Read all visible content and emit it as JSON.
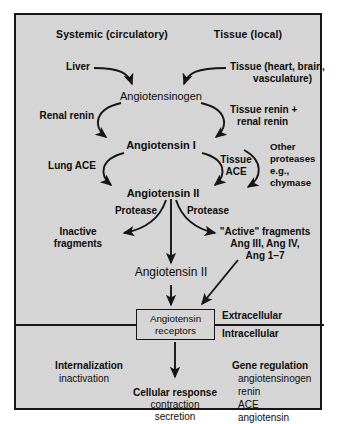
{
  "figure": {
    "title_left": "Systemic (circulatory)",
    "title_right": "Tissue (local)",
    "background_color": "#d5d5d5",
    "line_color": "#161616",
    "text_color": "#0c0c0c"
  },
  "sources": {
    "liver": "Liver",
    "tissue_line1": "Tissue (heart, brain,",
    "tissue_line2": "vasculature)"
  },
  "nodes": {
    "angiotensinogen": "Angiotensinogen",
    "angiotensin_1": "Angiotensin I",
    "angiotensin_2": "Angiotensin II",
    "angiotensin_2_pool": "Angiotensin II",
    "receptors_line1": "Angiotensin",
    "receptors_line2": "receptors"
  },
  "enzymes": {
    "renal_renin": "Renal renin",
    "tissue_renin_line1": "Tissue renin +",
    "tissue_renin_line2": "renal renin",
    "lung_ace": "Lung ACE",
    "tissue_ace_line1": "Tissue",
    "tissue_ace_line2": "ACE",
    "other_proteases_line1": "Other",
    "other_proteases_line2": "proteases",
    "other_proteases_line3": "e.g.,",
    "other_proteases_line4": "chymase",
    "protease_left": "Protease",
    "protease_right": "Protease"
  },
  "products": {
    "inactive_line1": "Inactive",
    "inactive_line2": "fragments",
    "active_line1": "\"Active\" fragments",
    "active_line2": "Ang III, Ang IV,",
    "active_line3": "Ang 1–7"
  },
  "compartments": {
    "extracellular": "Extracellular",
    "intracellular": "Intracellular"
  },
  "effects": {
    "internalization_title": "Internalization",
    "internalization_sub": "inactivation",
    "cellular_response_title": "Cellular response",
    "cellular_response_sub1": "contraction",
    "cellular_response_sub2": "secretion",
    "gene_regulation_title": "Gene regulation",
    "gene_items": [
      "angiotensinogen",
      "renin",
      "ACE",
      "angiotensin",
      " receptor"
    ]
  }
}
